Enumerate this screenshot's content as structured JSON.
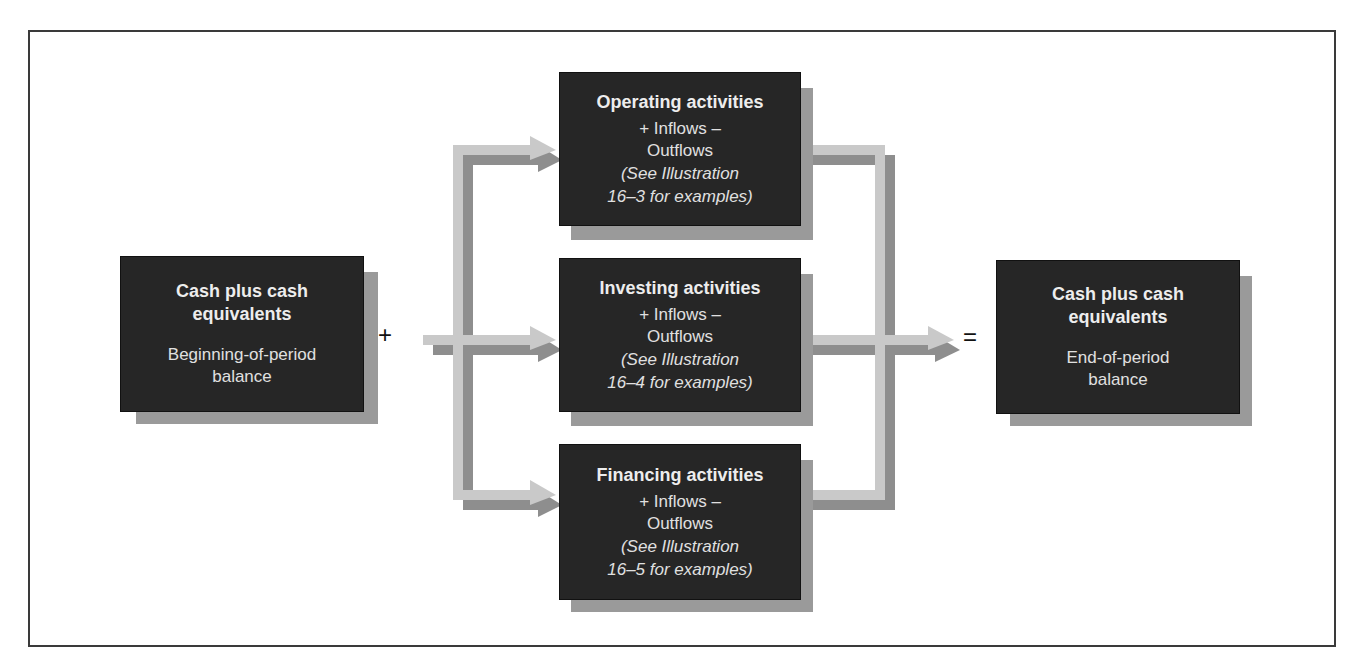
{
  "diagram": {
    "start_box": {
      "title": "Cash plus cash equivalents",
      "subtitle": "Beginning-of-period balance"
    },
    "plus_sign": "+",
    "equals_sign": "=",
    "activities": [
      {
        "title": "Operating activities",
        "flow_line1": "+ Inflows –",
        "flow_line2": "Outflows",
        "note_line1": "(See Illustration",
        "note_line2": "16–3 for examples)"
      },
      {
        "title": "Investing activities",
        "flow_line1": "+ Inflows –",
        "flow_line2": "Outflows",
        "note_line1": "(See Illustration",
        "note_line2": "16–4 for examples)"
      },
      {
        "title": "Financing activities",
        "flow_line1": "+ Inflows –",
        "flow_line2": "Outflows",
        "note_line1": "(See Illustration",
        "note_line2": "16–5 for examples)"
      }
    ],
    "end_box": {
      "title": "Cash plus cash equivalents",
      "subtitle": "End-of-period balance"
    },
    "colors": {
      "box_fill": "#262626",
      "box_text": "#e6e6e6",
      "shadow": "#9a9a9a",
      "arrow_light": "#c9c9c9",
      "arrow_dark": "#8e8e8e",
      "frame": "#3a3a3a"
    }
  }
}
